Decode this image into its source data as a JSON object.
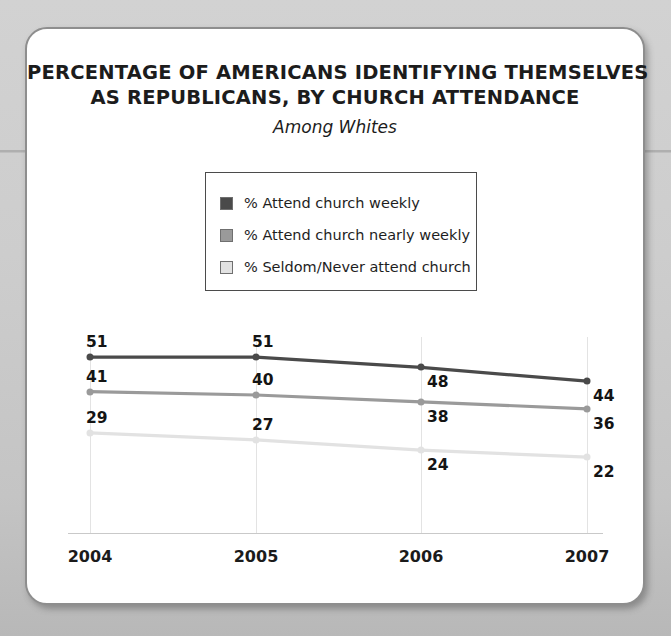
{
  "card": {
    "title_line_1": "PERCENTAGE OF AMERICANS IDENTIFYING THEMSELVES",
    "title_line_2": "AS REPUBLICANS, BY CHURCH ATTENDANCE",
    "subtitle": "Among Whites"
  },
  "legend": {
    "items": [
      {
        "label": "% Attend church weekly",
        "color": "#4a4a4a"
      },
      {
        "label": "% Attend church nearly weekly",
        "color": "#9a9a9a"
      },
      {
        "label": "% Seldom/Never attend church",
        "color": "#e2e2e2"
      }
    ]
  },
  "chart_data": {
    "type": "line",
    "title": "PERCENTAGE OF AMERICANS IDENTIFYING THEMSELVES AS REPUBLICANS, BY CHURCH ATTENDANCE",
    "subtitle": "Among Whites",
    "xlabel": "",
    "ylabel": "",
    "categories": [
      "2004",
      "2005",
      "2006",
      "2007"
    ],
    "ylim": [
      0,
      60
    ],
    "grid": "vertical",
    "legend_position": "top-center",
    "data_labels": true,
    "series": [
      {
        "name": "% Attend church weekly",
        "color": "#4a4a4a",
        "values": [
          51,
          51,
          48,
          44
        ]
      },
      {
        "name": "% Attend church nearly weekly",
        "color": "#9a9a9a",
        "values": [
          41,
          40,
          38,
          36
        ]
      },
      {
        "name": "% Seldom/Never attend church",
        "color": "#e2e2e2",
        "values": [
          29,
          27,
          24,
          22
        ]
      }
    ]
  }
}
